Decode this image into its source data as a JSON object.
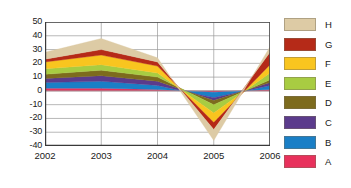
{
  "chart_data": {
    "type": "area",
    "stacked": true,
    "title": "",
    "subtitle": "",
    "xlabel": "",
    "ylabel": "",
    "categories": [
      "2002",
      "2003",
      "2004",
      "2005",
      "2006"
    ],
    "x": [
      2002,
      2003,
      2004,
      2005,
      2006
    ],
    "ylim": [
      -40,
      50
    ],
    "yticks": [
      50,
      40,
      30,
      20,
      10,
      0,
      -10,
      -20,
      -30,
      -40
    ],
    "ytick_labels": [
      "50",
      "40",
      "30",
      "20",
      "10",
      "0",
      "-10",
      "-20",
      "-30",
      "-40"
    ],
    "xticks": [
      2002,
      2003,
      2004,
      2005,
      2006
    ],
    "xtick_labels": [
      "2002",
      "2003",
      "2004",
      "2005",
      "2006"
    ],
    "grid": true,
    "grid_axis": "both",
    "legend_position": "right",
    "series": [
      {
        "name": "A",
        "color": "#e8315c",
        "values": [
          2,
          2,
          1,
          -1,
          1
        ]
      },
      {
        "name": "B",
        "color": "#1a7fc6",
        "values": [
          4,
          5,
          3,
          -4,
          3
        ]
      },
      {
        "name": "C",
        "color": "#5b3b8c",
        "values": [
          3,
          4,
          3,
          -2,
          2
        ]
      },
      {
        "name": "D",
        "color": "#7d6b1e",
        "values": [
          3,
          4,
          3,
          -3,
          2
        ]
      },
      {
        "name": "E",
        "color": "#a8cc42",
        "values": [
          4,
          4,
          3,
          -6,
          5
        ]
      },
      {
        "name": "F",
        "color": "#f9c51f",
        "values": [
          5,
          7,
          5,
          -7,
          6
        ]
      },
      {
        "name": "G",
        "color": "#b52a18",
        "values": [
          2,
          4,
          3,
          -5,
          9
        ]
      },
      {
        "name": "H",
        "color": "#ddcba5",
        "values": [
          5,
          8,
          3,
          -8,
          4
        ]
      }
    ],
    "cumulative_tops": {
      "2002": [
        2,
        6,
        9,
        12,
        16,
        21,
        23,
        28
      ],
      "2003": [
        2,
        7,
        11,
        15,
        19,
        26,
        30,
        38
      ],
      "2004": [
        1,
        4,
        7,
        10,
        13,
        18,
        21,
        24
      ],
      "2005": [
        -1,
        -5,
        -7,
        -10,
        -16,
        -23,
        -28,
        -36
      ],
      "2006": [
        1,
        4,
        6,
        8,
        13,
        19,
        28,
        32
      ]
    }
  },
  "legend": {
    "entries": [
      {
        "label": "H",
        "color": "#ddcba5"
      },
      {
        "label": "G",
        "color": "#b52a18"
      },
      {
        "label": "F",
        "color": "#f9c51f"
      },
      {
        "label": "E",
        "color": "#a8cc42"
      },
      {
        "label": "D",
        "color": "#7d6b1e"
      },
      {
        "label": "C",
        "color": "#5b3b8c"
      },
      {
        "label": "B",
        "color": "#1a7fc6"
      },
      {
        "label": "A",
        "color": "#e8315c"
      }
    ]
  },
  "axes": {
    "y_labels": [
      "50",
      "40",
      "30",
      "20",
      "10",
      "0",
      "-10",
      "-20",
      "-30",
      "-40"
    ],
    "x_labels": [
      "2002",
      "2003",
      "2004",
      "2005",
      "2006"
    ]
  },
  "style": {
    "grid_color": "#9a9a9a",
    "axis_color": "#4a4a4a",
    "background": "#ffffff",
    "text_color": "#1a1a1a"
  }
}
